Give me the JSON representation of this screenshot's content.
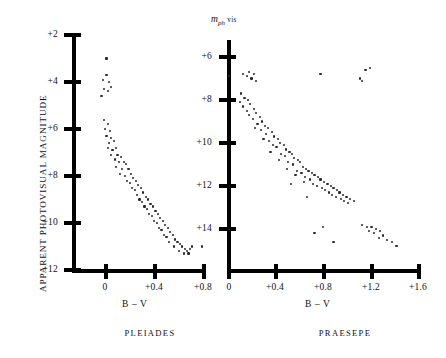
{
  "figure": {
    "yaxis_title_left": "APPARENT PHOTOVISUAL MAGNITUDE",
    "mph_symbol": "m",
    "mph_sub": "ph",
    "mph_vis": "vis"
  },
  "panels": [
    {
      "id": "pleiades",
      "caption": "PLEIADES",
      "xlabel": "B – V",
      "x_ticks": [
        "0",
        "+0.4",
        "+0.8"
      ],
      "y_ticks": [
        "+2",
        "+4",
        "+6",
        "+8",
        "+10",
        "+12"
      ]
    },
    {
      "id": "praesepe",
      "caption": "PRAESEPE",
      "xlabel": "B – V",
      "x_ticks": [
        "0",
        "+0.4",
        "+0.8",
        "+1.2",
        "+1.6"
      ],
      "y_ticks": [
        "+6",
        "+8",
        "+10",
        "+12",
        "+14"
      ]
    }
  ],
  "chart_data": [
    {
      "type": "scatter",
      "title": "PLEIADES",
      "xlabel": "B – V",
      "ylabel": "APPARENT PHOTOVISUAL MAGNITUDE",
      "xlim": [
        -0.12,
        0.92
      ],
      "ylim": [
        12.6,
        1.4
      ],
      "y_inverted": true,
      "xticks": [
        0,
        0.4,
        0.8
      ],
      "xticklabels": [
        "0",
        "+0.4",
        "+0.8"
      ],
      "yticks": [
        2,
        4,
        6,
        8,
        10,
        12
      ],
      "yticklabels": [
        "+2",
        "+4",
        "+6",
        "+8",
        "+10",
        "+12"
      ],
      "grid": false,
      "legend": null,
      "points": [
        [
          0.02,
          3.0
        ],
        [
          -0.01,
          3.9
        ],
        [
          0.02,
          3.7
        ],
        [
          0.04,
          4.0
        ],
        [
          0.0,
          4.3
        ],
        [
          0.03,
          4.4
        ],
        [
          0.06,
          4.2
        ],
        [
          -0.02,
          4.6
        ],
        [
          0.0,
          5.6
        ],
        [
          0.03,
          5.8
        ],
        [
          0.01,
          6.0
        ],
        [
          0.05,
          6.1
        ],
        [
          0.02,
          6.3
        ],
        [
          0.06,
          6.4
        ],
        [
          0.04,
          6.6
        ],
        [
          0.08,
          6.5
        ],
        [
          0.03,
          6.8
        ],
        [
          0.07,
          6.9
        ],
        [
          0.1,
          6.8
        ],
        [
          0.06,
          7.1
        ],
        [
          0.11,
          7.1
        ],
        [
          0.09,
          7.3
        ],
        [
          0.14,
          7.2
        ],
        [
          0.12,
          7.4
        ],
        [
          0.16,
          7.4
        ],
        [
          0.1,
          7.6
        ],
        [
          0.18,
          7.5
        ],
        [
          0.15,
          7.7
        ],
        [
          0.13,
          7.9
        ],
        [
          0.2,
          7.7
        ],
        [
          0.17,
          8.0
        ],
        [
          0.22,
          7.9
        ],
        [
          0.19,
          8.2
        ],
        [
          0.24,
          8.1
        ],
        [
          0.21,
          8.3
        ],
        [
          0.26,
          8.2
        ],
        [
          0.23,
          8.5
        ],
        [
          0.28,
          8.4
        ],
        [
          0.25,
          8.6
        ],
        [
          0.3,
          8.5
        ],
        [
          0.27,
          8.8
        ],
        [
          0.32,
          8.7
        ],
        [
          0.29,
          9.0
        ],
        [
          0.34,
          8.9
        ],
        [
          0.31,
          9.1
        ],
        [
          0.36,
          9.0
        ],
        [
          0.33,
          9.3
        ],
        [
          0.38,
          9.2
        ],
        [
          0.35,
          9.4
        ],
        [
          0.4,
          9.3
        ],
        [
          0.37,
          9.6
        ],
        [
          0.42,
          9.5
        ],
        [
          0.39,
          9.7
        ],
        [
          0.44,
          9.6
        ],
        [
          0.41,
          9.9
        ],
        [
          0.46,
          9.8
        ],
        [
          0.43,
          10.0
        ],
        [
          0.48,
          9.9
        ],
        [
          0.45,
          10.2
        ],
        [
          0.5,
          10.1
        ],
        [
          0.47,
          10.3
        ],
        [
          0.52,
          10.2
        ],
        [
          0.49,
          10.5
        ],
        [
          0.54,
          10.4
        ],
        [
          0.51,
          10.6
        ],
        [
          0.56,
          10.5
        ],
        [
          0.58,
          10.7
        ],
        [
          0.53,
          10.8
        ],
        [
          0.6,
          10.8
        ],
        [
          0.62,
          10.9
        ],
        [
          0.57,
          11.0
        ],
        [
          0.64,
          11.0
        ],
        [
          0.66,
          11.1
        ],
        [
          0.61,
          11.2
        ],
        [
          0.68,
          11.2
        ],
        [
          0.7,
          11.1
        ],
        [
          0.72,
          11.0
        ],
        [
          0.8,
          11.0
        ],
        [
          0.65,
          11.3
        ],
        [
          0.69,
          11.3
        ]
      ]
    },
    {
      "type": "scatter",
      "title": "PRAESEPE",
      "xlabel": "B – V",
      "ylabel": "m_ph vis",
      "xlim": [
        -0.1,
        1.78
      ],
      "ylim": [
        15.2,
        5.2
      ],
      "y_inverted": true,
      "xticks": [
        0,
        0.4,
        0.8,
        1.2,
        1.6
      ],
      "xticklabels": [
        "0",
        "+0.4",
        "+0.8",
        "+1.2",
        "+1.6"
      ],
      "yticks": [
        6,
        8,
        10,
        12,
        14
      ],
      "yticklabels": [
        "+6",
        "+8",
        "+10",
        "+12",
        "+14"
      ],
      "grid": false,
      "legend": null,
      "points": [
        [
          0.0,
          6.9
        ],
        [
          0.12,
          6.8
        ],
        [
          0.15,
          6.9
        ],
        [
          0.17,
          6.7
        ],
        [
          0.21,
          6.8
        ],
        [
          0.19,
          7.0
        ],
        [
          0.23,
          7.1
        ],
        [
          0.77,
          6.8
        ],
        [
          1.1,
          7.0
        ],
        [
          1.15,
          6.6
        ],
        [
          1.19,
          6.5
        ],
        [
          1.12,
          7.1
        ],
        [
          0.1,
          7.7
        ],
        [
          0.13,
          7.9
        ],
        [
          0.09,
          8.1
        ],
        [
          0.16,
          8.0
        ],
        [
          0.12,
          8.3
        ],
        [
          0.18,
          8.2
        ],
        [
          0.15,
          8.5
        ],
        [
          0.21,
          8.4
        ],
        [
          0.17,
          8.7
        ],
        [
          0.23,
          8.6
        ],
        [
          0.2,
          8.9
        ],
        [
          0.26,
          8.8
        ],
        [
          0.24,
          9.1
        ],
        [
          0.28,
          9.0
        ],
        [
          0.22,
          9.3
        ],
        [
          0.3,
          9.2
        ],
        [
          0.27,
          9.4
        ],
        [
          0.33,
          9.3
        ],
        [
          0.31,
          9.6
        ],
        [
          0.36,
          9.5
        ],
        [
          0.29,
          9.8
        ],
        [
          0.38,
          9.7
        ],
        [
          0.34,
          9.9
        ],
        [
          0.41,
          9.8
        ],
        [
          0.37,
          10.1
        ],
        [
          0.43,
          10.0
        ],
        [
          0.4,
          10.2
        ],
        [
          0.46,
          10.1
        ],
        [
          0.35,
          10.4
        ],
        [
          0.48,
          10.3
        ],
        [
          0.44,
          10.5
        ],
        [
          0.51,
          10.4
        ],
        [
          0.47,
          10.6
        ],
        [
          0.53,
          10.5
        ],
        [
          0.42,
          10.8
        ],
        [
          0.55,
          10.7
        ],
        [
          0.5,
          10.9
        ],
        [
          0.58,
          10.8
        ],
        [
          0.54,
          11.0
        ],
        [
          0.6,
          10.9
        ],
        [
          0.49,
          11.2
        ],
        [
          0.62,
          11.1
        ],
        [
          0.57,
          11.3
        ],
        [
          0.65,
          11.2
        ],
        [
          0.61,
          11.4
        ],
        [
          0.67,
          11.3
        ],
        [
          0.56,
          11.5
        ],
        [
          0.7,
          11.4
        ],
        [
          0.64,
          11.6
        ],
        [
          0.72,
          11.5
        ],
        [
          0.68,
          11.7
        ],
        [
          0.75,
          11.6
        ],
        [
          0.63,
          11.8
        ],
        [
          0.77,
          11.7
        ],
        [
          0.71,
          11.9
        ],
        [
          0.8,
          11.8
        ],
        [
          0.74,
          12.0
        ],
        [
          0.83,
          11.9
        ],
        [
          0.78,
          12.1
        ],
        [
          0.86,
          12.0
        ],
        [
          0.81,
          12.2
        ],
        [
          0.88,
          12.1
        ],
        [
          0.84,
          12.3
        ],
        [
          0.91,
          12.2
        ],
        [
          0.87,
          12.4
        ],
        [
          0.93,
          12.3
        ],
        [
          0.9,
          12.5
        ],
        [
          0.96,
          12.4
        ],
        [
          0.94,
          12.6
        ],
        [
          0.99,
          12.5
        ],
        [
          0.97,
          12.7
        ],
        [
          1.02,
          12.6
        ],
        [
          1.0,
          12.8
        ],
        [
          1.05,
          12.7
        ],
        [
          0.52,
          11.9
        ],
        [
          0.66,
          12.5
        ],
        [
          0.79,
          13.9
        ],
        [
          0.72,
          14.2
        ],
        [
          0.88,
          14.6
        ],
        [
          1.12,
          13.8
        ],
        [
          1.16,
          13.9
        ],
        [
          1.2,
          13.9
        ],
        [
          1.24,
          14.0
        ],
        [
          1.27,
          14.1
        ],
        [
          1.22,
          14.2
        ],
        [
          1.3,
          14.3
        ],
        [
          1.33,
          14.5
        ],
        [
          1.37,
          14.6
        ],
        [
          1.41,
          14.8
        ],
        [
          1.18,
          14.1
        ],
        [
          1.26,
          14.4
        ]
      ]
    }
  ]
}
